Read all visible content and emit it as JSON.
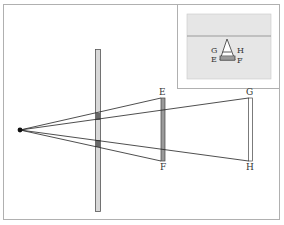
{
  "diagram": {
    "type": "pinhole-projection",
    "colors": {
      "frame": "#b0b0b0",
      "line": "#222222",
      "barrier_fill": "#d8d8d8",
      "screen_ef_fill": "#9a9a9a",
      "screen_gh_fill": "#ffffff",
      "inset_fill": "#e6e6e6",
      "inset_line": "#9a9a9a"
    },
    "labels": {
      "E": "E",
      "F": "F",
      "G": "G",
      "H": "H"
    },
    "inset": {
      "labels": {
        "G": "G",
        "H": "H",
        "E": "E",
        "F": "F"
      }
    }
  }
}
